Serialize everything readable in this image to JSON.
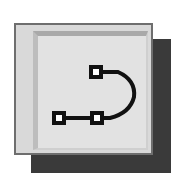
{
  "icon": {
    "name": "edit-path-nodes-icon",
    "nodes": [
      {
        "x": 96,
        "y": 72
      },
      {
        "x": 59,
        "y": 118
      },
      {
        "x": 97,
        "y": 118
      }
    ],
    "colors": {
      "face": "#d9d9d9",
      "inner": "#e2e2e2",
      "shadow": "#3a3a3a",
      "stroke": "#111111"
    }
  }
}
